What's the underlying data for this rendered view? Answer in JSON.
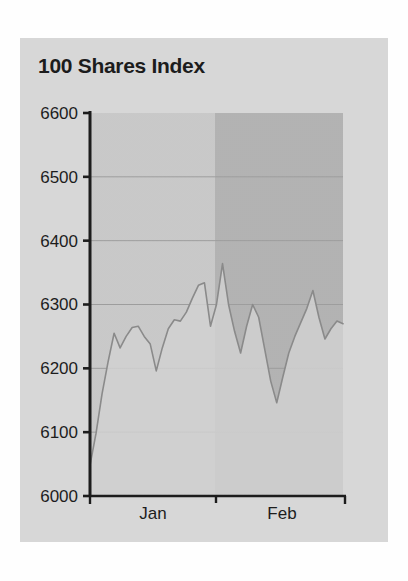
{
  "page": {
    "background_color": "#fefefe"
  },
  "panel": {
    "background_color": "#d8d8d8"
  },
  "chart_title": "100 Shares Index",
  "chart_data": {
    "type": "area",
    "title": "100 Shares Index",
    "xlabel": "",
    "ylabel": "",
    "ylim": [
      6000,
      6600
    ],
    "y_ticks": [
      6000,
      6100,
      6200,
      6300,
      6400,
      6500,
      6600
    ],
    "y_tick_labels": [
      "6000",
      "6100",
      "6200",
      "6300",
      "6400",
      "6500",
      "6600"
    ],
    "grid": true,
    "legend": null,
    "categories": [
      "Jan",
      "Feb"
    ],
    "x_tick_labels": [
      "Jan",
      "Feb"
    ],
    "band_colors": [
      "#c9c9c9",
      "#b3b3b3"
    ],
    "line_color": "#8a8a8a",
    "fill_color": "#d3d3d3",
    "series": [
      {
        "name": "100 Shares Index",
        "x": [
          0,
          1,
          2,
          3,
          4,
          5,
          6,
          7,
          8,
          9,
          10,
          11,
          12,
          13,
          14,
          15,
          16,
          17,
          18,
          19,
          20,
          21,
          22,
          23,
          24,
          25,
          26,
          27,
          28,
          29,
          30,
          31,
          32,
          33,
          34,
          35,
          36,
          37,
          38,
          39,
          40,
          41,
          42
        ],
        "values": [
          6048,
          6098,
          6160,
          6210,
          6255,
          6232,
          6250,
          6264,
          6266,
          6250,
          6238,
          6196,
          6232,
          6262,
          6276,
          6274,
          6288,
          6310,
          6330,
          6334,
          6266,
          6300,
          6364,
          6300,
          6258,
          6224,
          6266,
          6300,
          6280,
          6230,
          6180,
          6146,
          6186,
          6224,
          6250,
          6272,
          6294,
          6322,
          6280,
          6246,
          6262,
          6274,
          6270
        ]
      }
    ],
    "band_split_index": 20,
    "annotations": []
  },
  "axis": {
    "y_axis_color": "#1a1a1a",
    "x_axis_color": "#1a1a1a",
    "gridline_color": "#9d9d9d"
  }
}
